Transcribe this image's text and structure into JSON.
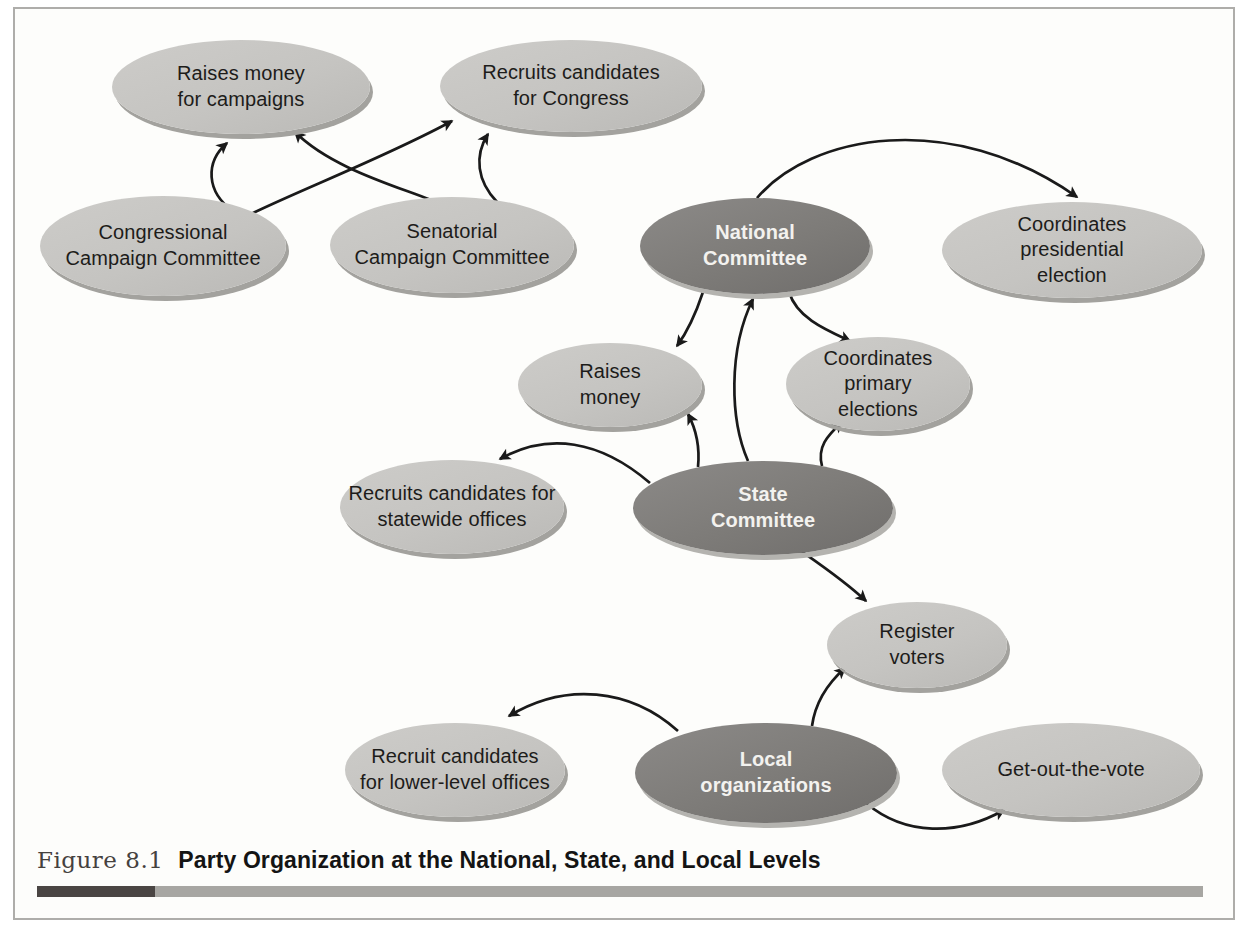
{
  "figure": {
    "label": "Figure 8.1",
    "title": "Party Organization at the National, State, and Local Levels"
  },
  "colors": {
    "committee_fill": "#7d7b78",
    "function_fill": "#c5c4c1",
    "committee_text": "#f3f2ef",
    "function_text": "#1d1c1a",
    "arrow": "#1a1a1a",
    "caption_bar_dark": "#4a4543",
    "caption_bar_light": "#a7a6a2",
    "frame_border": "#aeadaa"
  },
  "diagram": {
    "nodes": {
      "raises_campaigns": {
        "label": "Raises money\nfor campaigns",
        "type": "function"
      },
      "recruits_congress": {
        "label": "Recruits candidates\nfor Congress",
        "type": "function"
      },
      "congressional": {
        "label": "Congressional\nCampaign Committee",
        "type": "function"
      },
      "senatorial": {
        "label": "Senatorial\nCampaign Committee",
        "type": "function"
      },
      "national": {
        "label": "National\nCommittee",
        "type": "committee"
      },
      "coord_pres": {
        "label": "Coordinates\npresidential\nelection",
        "type": "function"
      },
      "raises_money": {
        "label": "Raises\nmoney",
        "type": "function"
      },
      "coord_primary": {
        "label": "Coordinates\nprimary\nelections",
        "type": "function"
      },
      "recruits_statewide": {
        "label": "Recruits candidates for\nstatewide offices",
        "type": "function"
      },
      "state": {
        "label": "State\nCommittee",
        "type": "committee"
      },
      "register_voters": {
        "label": "Register\nvoters",
        "type": "function"
      },
      "recruit_lower": {
        "label": "Recruit candidates\nfor lower-level offices",
        "type": "function"
      },
      "local": {
        "label": "Local\norganizations",
        "type": "committee"
      },
      "gotv": {
        "label": "Get-out-the-vote",
        "type": "function"
      }
    },
    "edges": [
      {
        "from": "congressional",
        "to": "raises_campaigns"
      },
      {
        "from": "congressional",
        "to": "recruits_congress"
      },
      {
        "from": "senatorial",
        "to": "raises_campaigns"
      },
      {
        "from": "senatorial",
        "to": "recruits_congress"
      },
      {
        "from": "national",
        "to": "coord_pres"
      },
      {
        "from": "national",
        "to": "raises_money"
      },
      {
        "from": "national",
        "to": "coord_primary"
      },
      {
        "from": "state",
        "to": "national"
      },
      {
        "from": "state",
        "to": "raises_money"
      },
      {
        "from": "state",
        "to": "coord_primary"
      },
      {
        "from": "state",
        "to": "recruits_statewide"
      },
      {
        "from": "state",
        "to": "register_voters"
      },
      {
        "from": "local",
        "to": "register_voters"
      },
      {
        "from": "local",
        "to": "recruit_lower"
      },
      {
        "from": "local",
        "to": "gotv"
      }
    ]
  }
}
